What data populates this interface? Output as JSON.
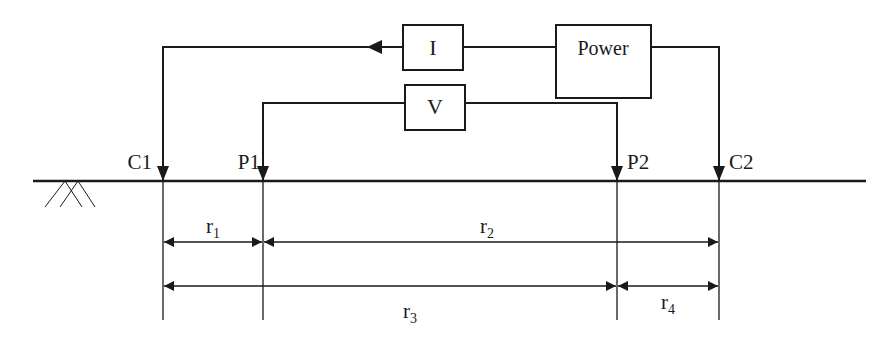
{
  "diagram": {
    "type": "electrode-array-schematic",
    "boxes": {
      "current": {
        "label": "I"
      },
      "voltage": {
        "label": "V"
      },
      "power": {
        "label": "Power"
      }
    },
    "electrodes": [
      {
        "id": "C1",
        "label": "C1"
      },
      {
        "id": "P1",
        "label": "P1"
      },
      {
        "id": "P2",
        "label": "P2"
      },
      {
        "id": "C2",
        "label": "C2"
      }
    ],
    "distances": [
      {
        "id": "r1",
        "base": "r",
        "sub": "1",
        "from": "C1",
        "to": "P1"
      },
      {
        "id": "r2",
        "base": "r",
        "sub": "2",
        "from": "P1",
        "to": "C2"
      },
      {
        "id": "r3",
        "base": "r",
        "sub": "3",
        "from": "C1",
        "to": "P2"
      },
      {
        "id": "r4",
        "base": "r",
        "sub": "4",
        "from": "P2",
        "to": "C2"
      }
    ],
    "colors": {
      "stroke": "#1a1a1a",
      "background": "#ffffff"
    }
  }
}
